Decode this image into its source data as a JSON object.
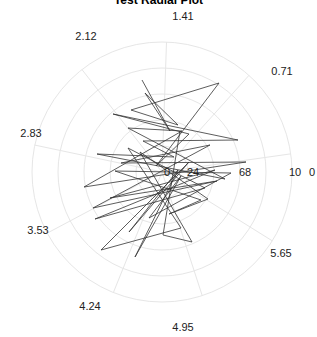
{
  "chart_data": {
    "type": "line",
    "subtype": "polar",
    "title": "Test Radial Plot",
    "xlabel": "",
    "ylabel": "",
    "angular_ticks": [
      "0",
      "0.71",
      "1.41",
      "2.12",
      "2.83",
      "3.53",
      "4.24",
      "4.95",
      "5.65"
    ],
    "angular_tick_values_rad": [
      0,
      0.698,
      1.396,
      2.094,
      2.793,
      3.491,
      4.189,
      4.887,
      5.585
    ],
    "radial_ticks": [
      "0",
      "2",
      "4",
      "6",
      "8",
      "10"
    ],
    "radial_tick_display": [
      "0",
      "24",
      "68",
      "10"
    ],
    "rlim": [
      0,
      10
    ],
    "grid": true,
    "legend": null,
    "line_color": "#333333",
    "grid_color": "#e6e6e6",
    "series": [
      {
        "name": "series-1",
        "points_xy_px": [
          [
            142,
            80
          ],
          [
            170,
            131
          ],
          [
            145,
            93
          ],
          [
            178,
            125
          ],
          [
            131,
            110
          ],
          [
            219,
            83
          ],
          [
            156,
            166
          ],
          [
            189,
            134
          ],
          [
            113,
            114
          ],
          [
            238,
            140
          ],
          [
            143,
            141
          ],
          [
            174,
            157
          ],
          [
            97,
            154
          ],
          [
            225,
            179
          ],
          [
            128,
            128
          ],
          [
            182,
            131
          ],
          [
            84,
            187
          ],
          [
            246,
            162
          ],
          [
            121,
            163
          ],
          [
            210,
            145
          ],
          [
            93,
            208
          ],
          [
            217,
            181
          ],
          [
            110,
            198
          ],
          [
            215,
            170
          ],
          [
            95,
            219
          ],
          [
            205,
            188
          ],
          [
            128,
            148
          ],
          [
            181,
            228
          ],
          [
            101,
            250
          ],
          [
            189,
            162
          ],
          [
            129,
            232
          ],
          [
            178,
            170
          ],
          [
            135,
            257
          ],
          [
            181,
            176
          ],
          [
            149,
            218
          ],
          [
            231,
            173
          ],
          [
            115,
            171
          ],
          [
            201,
            200
          ],
          [
            169,
            214
          ],
          [
            208,
            199
          ],
          [
            140,
            152
          ],
          [
            192,
            242
          ],
          [
            163,
            235
          ],
          [
            180,
            131
          ]
        ]
      }
    ]
  },
  "plot": {
    "center": [
      162,
      172
    ],
    "outer_radius": 130,
    "ring_radii": [
      26,
      52,
      78,
      104,
      130
    ]
  }
}
